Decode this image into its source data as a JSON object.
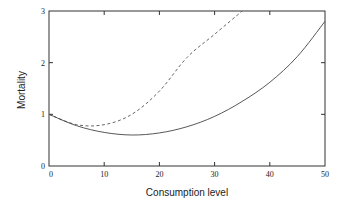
{
  "chart_data": {
    "type": "line",
    "title": "",
    "xlabel": "Consumption level",
    "ylabel": "Mortality",
    "xlim": [
      0,
      50
    ],
    "ylim": [
      0,
      3
    ],
    "xticks": [
      "0",
      "10",
      "20",
      "30",
      "40",
      "50"
    ],
    "yticks": [
      "0",
      "1",
      "2",
      "3"
    ],
    "grid": false,
    "legend": null,
    "x": [
      0,
      5,
      10,
      15,
      20,
      25,
      30,
      35,
      40,
      45,
      50
    ],
    "series": [
      {
        "name": "solid",
        "style": "solid",
        "values": [
          1.0,
          0.78,
          0.65,
          0.6,
          0.64,
          0.76,
          0.96,
          1.25,
          1.62,
          2.12,
          2.8
        ]
      },
      {
        "name": "dashed",
        "style": "dashed",
        "values": [
          1.0,
          0.8,
          0.8,
          1.0,
          1.45,
          2.1,
          2.55,
          3.0,
          null,
          null,
          null
        ]
      }
    ]
  }
}
